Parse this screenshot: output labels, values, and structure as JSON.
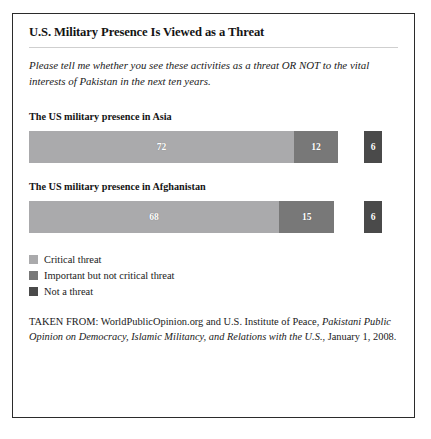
{
  "figure": {
    "title": "U.S. Military Presence Is Viewed as a Threat",
    "question": "Please tell me whether you see these activities as a threat OR NOT to the vital interests of Pakistan in the next ten years."
  },
  "legend": {
    "items": [
      {
        "label": "Critical threat",
        "color": "#aaaaac",
        "key": "critical"
      },
      {
        "label": "Important but not critical threat",
        "color": "#787878",
        "key": "important"
      },
      {
        "label": "Not a threat",
        "color": "#4a4a4a",
        "key": "not_a_threat"
      }
    ]
  },
  "source": {
    "prefix": "TAKEN FROM: WorldPublicOpinion.org and U.S. Institute of Peace,",
    "publication": "Pakistani Public Opinion on Democracy, Islamic Militancy, and Relations with the U.S.",
    "suffix": ", January 1, 2008."
  },
  "chart_data": {
    "type": "bar",
    "orientation": "horizontal",
    "stacked": true,
    "title": "U.S. Military Presence Is Viewed as a Threat",
    "subtitle": "Please tell me whether you see these activities as a threat OR NOT to the vital interests of Pakistan in the next ten years.",
    "xlabel": "",
    "ylabel": "",
    "units": "percent",
    "xlim": [
      0,
      100
    ],
    "grid": false,
    "legend_position": "bottom-left",
    "categories": [
      "The US military presence in Asia",
      "The US military presence in Afghanistan"
    ],
    "series": [
      {
        "name": "Critical threat",
        "color": "#aaaaac",
        "values": [
          72,
          68
        ]
      },
      {
        "name": "Important but not critical threat",
        "color": "#787878",
        "values": [
          12,
          15
        ]
      },
      {
        "name": "Not a threat",
        "color": "#4a4a4a",
        "values": [
          6,
          6
        ]
      }
    ],
    "bars": [
      {
        "category": "The US military presence in Asia",
        "segments": [
          {
            "name": "Critical threat",
            "value": 72,
            "label": "72",
            "start": 0,
            "end": 72,
            "detached": false
          },
          {
            "name": "Important but not critical threat",
            "value": 12,
            "label": "12",
            "start": 72,
            "end": 84,
            "detached": false
          },
          {
            "name": "Not a threat",
            "value": 6,
            "label": "6",
            "start": 91,
            "end": 96,
            "detached": true
          }
        ]
      },
      {
        "category": "The US military presence in Afghanistan",
        "segments": [
          {
            "name": "Critical threat",
            "value": 68,
            "label": "68",
            "start": 0,
            "end": 68,
            "detached": false
          },
          {
            "name": "Important but not critical threat",
            "value": 15,
            "label": "15",
            "start": 68,
            "end": 83,
            "detached": false
          },
          {
            "name": "Not a threat",
            "value": 6,
            "label": "6",
            "start": 91,
            "end": 96,
            "detached": true
          }
        ]
      }
    ]
  }
}
